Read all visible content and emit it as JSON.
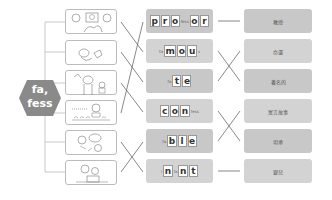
{
  "root": {
    "line1": "fa,",
    "line2": "fess",
    "color": "#8a8a8a"
  },
  "pictures": [
    {
      "name": "teacher-students-picture",
      "top": 9
    },
    {
      "name": "fortune-bird-picture",
      "top": 40
    },
    {
      "name": "famous-person-picture",
      "top": 70
    },
    {
      "name": "confession-crowd-picture",
      "top": 100
    },
    {
      "name": "fable-speech-picture",
      "top": 130
    },
    {
      "name": "infant-picture",
      "top": 160
    }
  ],
  "words": [
    {
      "pre": "",
      "tiles": [
        "p",
        "r",
        "o"
      ],
      "mid": "fess",
      "tiles2": [
        "o",
        "r"
      ],
      "post": "",
      "top": 9
    },
    {
      "pre": "fa",
      "tiles": [
        "m",
        "o",
        "u"
      ],
      "mid": "",
      "tiles2": [],
      "post": "s",
      "top": 39
    },
    {
      "pre": "fa",
      "tiles": [
        "t",
        "e"
      ],
      "mid": "",
      "tiles2": [],
      "post": "",
      "top": 69
    },
    {
      "pre": "",
      "tiles": [
        "c",
        "o",
        "n"
      ],
      "mid": "fess",
      "tiles2": [],
      "post": "",
      "top": 99
    },
    {
      "pre": "fa",
      "tiles": [
        "b",
        "l",
        "e"
      ],
      "mid": "",
      "tiles2": [],
      "post": "",
      "top": 129
    },
    {
      "pre": "i",
      "tiles": [
        "n"
      ],
      "mid": "fa",
      "tiles2": [
        "n",
        "t"
      ],
      "post": "",
      "top": 159
    }
  ],
  "meanings": [
    {
      "text": "教授",
      "top": 9
    },
    {
      "text": "命運",
      "top": 39
    },
    {
      "text": "著名的",
      "top": 69
    },
    {
      "text": "寓言故事",
      "top": 99
    },
    {
      "text": "坦承",
      "top": 129
    },
    {
      "text": "嬰兒",
      "top": 159
    }
  ],
  "left_connections": [
    {
      "from": 0,
      "to": 1
    },
    {
      "from": 1,
      "to": 2
    },
    {
      "from": 2,
      "to": 3
    },
    {
      "from": 3,
      "to": 0
    },
    {
      "from": 4,
      "to": 5
    },
    {
      "from": 5,
      "to": 4
    }
  ],
  "right_connections": [
    {
      "from": 0,
      "to": 0
    },
    {
      "from": 1,
      "to": 2
    },
    {
      "from": 2,
      "to": 1
    },
    {
      "from": 3,
      "to": 4
    },
    {
      "from": 4,
      "to": 3
    },
    {
      "from": 5,
      "to": 5
    }
  ]
}
